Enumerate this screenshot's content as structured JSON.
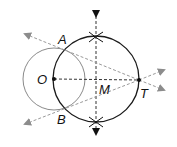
{
  "diagram": {
    "labels": {
      "A": "A",
      "B": "B",
      "O": "O",
      "M": "M",
      "T": "T"
    },
    "colors": {
      "small_circle": "#8a8a8a",
      "large_circle": "#1a1a1a",
      "dashed_lines": "#9a9a9a",
      "axis_line": "#333333",
      "arrows": "#8c8c8c",
      "points": "#111111"
    },
    "points": {
      "O": [
        54,
        79
      ],
      "M": [
        96,
        79
      ],
      "T": [
        139,
        80
      ],
      "A": [
        62,
        48
      ],
      "B": [
        62,
        110
      ]
    },
    "circles": [
      {
        "name": "circle-O",
        "center": "O",
        "radius": 31
      },
      {
        "name": "circle-M",
        "center": "M",
        "radius": 43
      }
    ]
  }
}
